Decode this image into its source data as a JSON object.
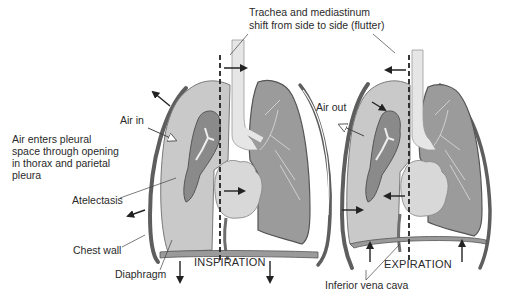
{
  "diagram": {
    "type": "medical-illustration",
    "panels": [
      {
        "id": "inspiration",
        "caption": "INSPIRATION"
      },
      {
        "id": "expiration",
        "caption": "EXPIRATION"
      }
    ],
    "labels": {
      "trachea_line1": "Trachea and mediastinum",
      "trachea_line2": "shift from side to side (flutter)",
      "air_in": "Air in",
      "air_out": "Air out",
      "air_enters": "Air enters pleural space through opening in thorax and parietal pleura",
      "atelectasis": "Atelectasis",
      "chest_wall": "Chest wall",
      "diaphragm": "Diaphragm",
      "inferior_vena_cava": "Inferior vena cava",
      "inspiration": "INSPIRATION",
      "expiration": "EXPIRATION"
    },
    "colors": {
      "pleural_space": "#c9c9c9",
      "collapsed_lung": "#8a8a8a",
      "normal_lung": "#9b9b9b",
      "lung_outline": "#555555",
      "chest_wall": "#5e5e5e",
      "heart": "#d8d8d8",
      "trachea": "#e6e6e6",
      "arrow": "#222222",
      "background": "#ffffff"
    }
  }
}
